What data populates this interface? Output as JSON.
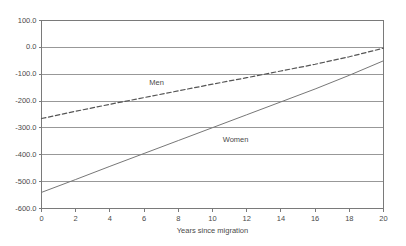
{
  "chart_data": {
    "type": "line",
    "title": "",
    "subtitle": "",
    "xlabel": "Years since migration",
    "ylabel": "",
    "xlim": [
      0,
      20
    ],
    "ylim": [
      -600,
      100
    ],
    "xticks": [
      0,
      2,
      4,
      6,
      8,
      10,
      12,
      14,
      16,
      18,
      20
    ],
    "xtick_labels": [
      "0",
      "2",
      "4",
      "6",
      "8",
      "10",
      "12",
      "14",
      "16",
      "18",
      "20"
    ],
    "yticks": [
      100,
      0,
      -100,
      -200,
      -300,
      -400,
      -500,
      -600
    ],
    "ytick_labels": [
      "100.0",
      "0.0",
      "-100.0",
      "-200.0",
      "-300.0",
      "-400.0",
      "-500.0",
      "-600.0"
    ],
    "grid": "horizontal",
    "legend_position": "inline-annotations",
    "x": [
      0,
      2,
      4,
      6,
      8,
      10,
      12,
      14,
      16,
      18,
      20
    ],
    "series": [
      {
        "name": "Men",
        "style": "dashed",
        "color": "#555555",
        "values": [
          -265,
          -238,
          -212,
          -187,
          -162,
          -137,
          -113,
          -88,
          -63,
          -35,
          -3
        ]
      },
      {
        "name": "Women",
        "style": "solid",
        "color": "#777777",
        "values": [
          -540,
          -492,
          -443,
          -395,
          -347,
          -299,
          -251,
          -203,
          -155,
          -104,
          -50
        ]
      }
    ],
    "annotations": [
      {
        "text": "Men",
        "x": 6.3,
        "y": -132
      },
      {
        "text": "Women",
        "x": 10.6,
        "y": -345
      }
    ]
  },
  "style": {
    "axis_color": "#7a7a7a",
    "grid_color": "#8d8d8d",
    "text_color": "#4a4a4a",
    "background": "#ffffff"
  }
}
